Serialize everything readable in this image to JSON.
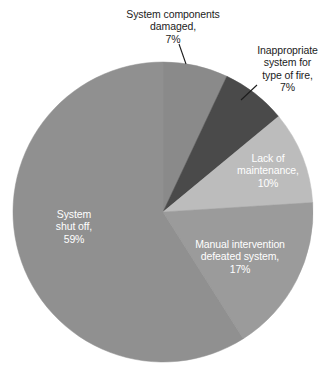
{
  "chart_data": {
    "type": "pie",
    "title": "",
    "subtitle": "",
    "xlabel": "",
    "ylabel": "",
    "legend_position": "none",
    "grid": false,
    "start_angle_deg": 0,
    "direction": "clockwise",
    "categories": [
      "System components damaged",
      "Inappropriate system for type of fire",
      "Lack of maintenance",
      "Manual intervention defeated system",
      "System shut off"
    ],
    "values": [
      7,
      7,
      10,
      17,
      59
    ],
    "value_suffix": "%",
    "total": 100,
    "slices": [
      {
        "name": "System components damaged",
        "label_line1": "System components",
        "label_line2": "damaged,",
        "label_line3": "7%",
        "value": 7,
        "value_text": "7%",
        "color": "#8a8a8a",
        "label_placement": "outside",
        "label_color": "#1c1c1c",
        "leader_line": true
      },
      {
        "name": "Inappropriate system for type of fire",
        "label_line1": "Inappropriate",
        "label_line2": "system for",
        "label_line3": "type of fire,",
        "label_line4": "7%",
        "value": 7,
        "value_text": "7%",
        "color": "#4a4a4a",
        "label_placement": "outside",
        "label_color": "#1c1c1c",
        "leader_line": true
      },
      {
        "name": "Lack of maintenance",
        "label_line1": "Lack of",
        "label_line2": "maintenance,",
        "label_line3": "10%",
        "value": 10,
        "value_text": "10%",
        "color": "#bcbcbc",
        "label_placement": "inside",
        "label_color": "#ffffff",
        "leader_line": false
      },
      {
        "name": "Manual intervention defeated system",
        "label_line1": "Manual intervention",
        "label_line2": "defeated system,",
        "label_line3": "17%",
        "value": 17,
        "value_text": "17%",
        "color": "#9b9b9b",
        "label_placement": "inside",
        "label_color": "#ffffff",
        "leader_line": false
      },
      {
        "name": "System shut off",
        "label_line1": "System",
        "label_line2": "shut off,",
        "label_line3": "59%",
        "value": 59,
        "value_text": "59%",
        "color": "#909090",
        "label_placement": "inside",
        "label_color": "#ffffff",
        "leader_line": false
      }
    ]
  },
  "labels": {
    "system_components_damaged": "System components\ndamaged,\n7%",
    "inappropriate_system": "Inappropriate\nsystem for\ntype of fire,\n7%",
    "lack_of_maintenance": "Lack of\nmaintenance,\n10%",
    "manual_intervention": "Manual intervention\ndefeated system,\n17%",
    "system_shut_off": "System\nshut off,\n59%"
  },
  "colors": {
    "background": "#ffffff",
    "leader_line": "#1c1c1c",
    "outside_label_text": "#1c1c1c",
    "inside_label_text": "#ffffff"
  }
}
